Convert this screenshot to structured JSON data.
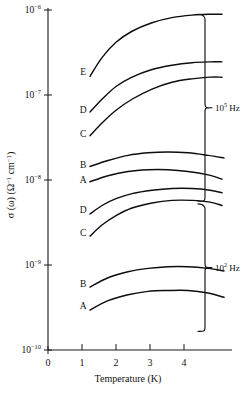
{
  "chart_data": {
    "type": "line",
    "title": "",
    "xlabel": "Temperature (K)",
    "ylabel": "σ (ω) (Ω⁻¹ cm⁻¹)",
    "ylabel_parts": {
      "sigma": "σ (ω)",
      "units_open": "(Ω",
      "units_exp1": "−1",
      "units_mid": " cm",
      "units_exp2": "−1",
      "units_close": ")"
    },
    "xlim": [
      0,
      4.6
    ],
    "ylim_log10": [
      -10,
      -6
    ],
    "xticks": [
      0,
      1,
      2,
      3,
      4
    ],
    "xtick_labels": [
      "0",
      "1",
      "2",
      "3",
      "4"
    ],
    "yticks_log10": [
      -6,
      -7,
      -8,
      -9,
      -10
    ],
    "ytick_mantissa": "10",
    "ytick_exponents": [
      "−6",
      "−7",
      "−8",
      "−9",
      "−10"
    ],
    "grid": false,
    "legend": "none",
    "groups": [
      {
        "name": "upper-group",
        "frequency_label": "Hz",
        "frequency_mantissa": "10",
        "frequency_exponent": "5",
        "brace_top_y_log10": -6.05,
        "brace_bottom_y_log10": -8.25,
        "series": [
          {
            "name": "E",
            "label": "E",
            "label_x": 0.88,
            "label_y_log10": -6.72,
            "x": [
              1.05,
              1.35,
              1.7,
              2.1,
              2.6,
              3.1,
              3.6,
              4.05,
              4.35
            ],
            "y_log10": [
              -6.78,
              -6.56,
              -6.38,
              -6.25,
              -6.15,
              -6.09,
              -6.06,
              -6.05,
              -6.05
            ]
          },
          {
            "name": "D-upper",
            "label": "D",
            "label_x": 0.88,
            "label_y_log10": -7.17,
            "x": [
              1.05,
              1.35,
              1.7,
              2.1,
              2.6,
              3.1,
              3.6,
              4.05,
              4.35
            ],
            "y_log10": [
              -7.2,
              -7.05,
              -6.9,
              -6.79,
              -6.7,
              -6.65,
              -6.62,
              -6.61,
              -6.61
            ]
          },
          {
            "name": "C-upper",
            "label": "C",
            "label_x": 0.88,
            "label_y_log10": -7.45,
            "x": [
              1.05,
              1.35,
              1.7,
              2.1,
              2.6,
              3.1,
              3.6,
              4.05,
              4.35
            ],
            "y_log10": [
              -7.48,
              -7.33,
              -7.18,
              -7.05,
              -6.93,
              -6.85,
              -6.81,
              -6.79,
              -6.79
            ]
          },
          {
            "name": "B-upper",
            "label": "B",
            "label_x": 0.88,
            "label_y_log10": -7.82,
            "x": [
              1.05,
              1.5,
              2.0,
              2.5,
              3.0,
              3.5,
              4.0,
              4.4
            ],
            "y_log10": [
              -7.84,
              -7.77,
              -7.71,
              -7.68,
              -7.67,
              -7.68,
              -7.71,
              -7.74
            ]
          },
          {
            "name": "A-upper",
            "label": "A",
            "label_x": 0.88,
            "label_y_log10": -8.0,
            "x": [
              1.05,
              1.5,
              2.0,
              2.5,
              3.0,
              3.5,
              4.0,
              4.35
            ],
            "y_log10": [
              -8.02,
              -7.95,
              -7.9,
              -7.88,
              -7.88,
              -7.9,
              -7.94,
              -7.99
            ]
          }
        ]
      },
      {
        "name": "lower-group",
        "frequency_label": "Hz",
        "frequency_mantissa": "10",
        "frequency_exponent": "2",
        "brace_top_y_log10": -8.28,
        "brace_bottom_y_log10": -9.78,
        "series": [
          {
            "name": "D-lower",
            "label": "D",
            "label_x": 0.88,
            "label_y_log10": -8.35,
            "x": [
              1.05,
              1.35,
              1.7,
              2.1,
              2.6,
              3.1,
              3.6,
              4.05,
              4.35
            ],
            "y_log10": [
              -8.4,
              -8.3,
              -8.22,
              -8.16,
              -8.12,
              -8.1,
              -8.1,
              -8.12,
              -8.15
            ]
          },
          {
            "name": "C-lower",
            "label": "C",
            "label_x": 0.88,
            "label_y_log10": -8.62,
            "x": [
              1.05,
              1.35,
              1.7,
              2.1,
              2.6,
              3.1,
              3.6,
              4.05,
              4.35
            ],
            "y_log10": [
              -8.66,
              -8.53,
              -8.42,
              -8.33,
              -8.27,
              -8.24,
              -8.24,
              -8.26,
              -8.3
            ]
          },
          {
            "name": "B-lower",
            "label": "B",
            "label_x": 0.88,
            "label_y_log10": -9.22,
            "x": [
              1.05,
              1.5,
              2.0,
              2.5,
              3.0,
              3.5,
              4.0,
              4.4
            ],
            "y_log10": [
              -9.26,
              -9.15,
              -9.08,
              -9.04,
              -9.02,
              -9.02,
              -9.04,
              -9.07
            ]
          },
          {
            "name": "A-lower",
            "label": "A",
            "label_x": 0.88,
            "label_y_log10": -9.48,
            "x": [
              1.05,
              1.5,
              2.0,
              2.5,
              3.0,
              3.5,
              4.0,
              4.4
            ],
            "y_log10": [
              -9.53,
              -9.42,
              -9.35,
              -9.31,
              -9.3,
              -9.3,
              -9.33,
              -9.38
            ]
          }
        ]
      }
    ]
  },
  "colors": {
    "ink": "#111111",
    "curve": "#0d0d0d",
    "background": "#ffffff"
  }
}
